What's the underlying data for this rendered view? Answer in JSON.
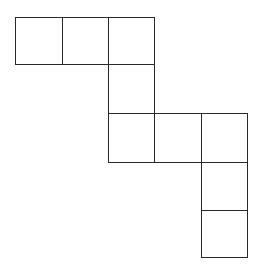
{
  "diagram": {
    "type": "square-net",
    "stroke_color": "#2a2a2a",
    "fill_color": "#ffffff",
    "grid": {
      "col_lines_x": [
        15,
        62,
        108,
        154,
        201,
        247
      ],
      "row_lines_y": [
        17,
        64,
        113,
        162,
        210,
        257
      ]
    },
    "cells": [
      {
        "row": 0,
        "col": 0
      },
      {
        "row": 0,
        "col": 1
      },
      {
        "row": 0,
        "col": 2
      },
      {
        "row": 1,
        "col": 2
      },
      {
        "row": 2,
        "col": 2
      },
      {
        "row": 2,
        "col": 3
      },
      {
        "row": 2,
        "col": 4
      },
      {
        "row": 3,
        "col": 4
      },
      {
        "row": 4,
        "col": 4
      }
    ]
  }
}
